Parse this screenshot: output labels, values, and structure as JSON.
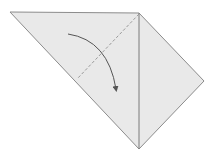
{
  "diagram": {
    "type": "origami-fold-step",
    "colors": {
      "paper": "#e9e9e9",
      "edge": "#8c8c8c",
      "crease": "#7a7a7a",
      "dashed": "#9a9a9a",
      "arrow": "#555555",
      "background": "#ffffff"
    },
    "shape": {
      "top_left": [
        10,
        12
      ],
      "top": [
        139,
        13
      ],
      "right": [
        204,
        81
      ],
      "bottom": [
        139,
        149
      ]
    },
    "crease_line": {
      "from": [
        139,
        13
      ],
      "to": [
        139,
        149
      ]
    },
    "valley_fold_line": {
      "from": [
        139,
        14
      ],
      "to": [
        77,
        79
      ]
    },
    "fold_arrow": {
      "from": [
        68,
        34
      ],
      "control": [
        108,
        40
      ],
      "to": [
        116,
        89
      ]
    }
  }
}
